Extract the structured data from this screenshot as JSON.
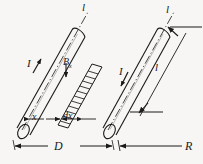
{
  "figure": {
    "type": "physics-diagram",
    "background_color": "#f7f6f4",
    "ink_color": "#1a1a1a"
  },
  "labels": {
    "current_left": "I",
    "current_right": "I",
    "field": "B",
    "field_subscript": "x",
    "distance_x": "x",
    "element_dx": "dx",
    "separation": "D",
    "radius": "R",
    "length_right": "l",
    "axis_left": "l",
    "axis_right": "l"
  },
  "elements": {
    "left_cylinder": "left-conductor",
    "right_cylinder": "right-conductor",
    "hatched_strip": "field-strip",
    "axis_left": "left-center-axis",
    "axis_right": "right-center-axis",
    "dimension_D": "separation-dimension",
    "dimension_R": "radius-dimension",
    "dimension_l": "length-dimension",
    "dimension_x": "x-dimension"
  }
}
